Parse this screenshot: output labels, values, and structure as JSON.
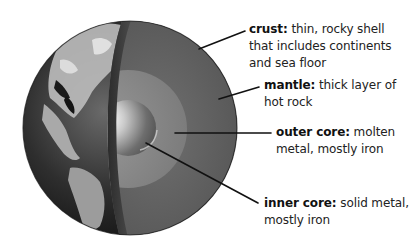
{
  "diagram": {
    "colors": {
      "background": "#ffffff",
      "ocean_dark": "#1c1c1c",
      "land_light": "#c8c8c8",
      "crust_band": "#3e3e3e",
      "mantle": "#626262",
      "outer_core": "#8a8a8a",
      "inner_core_highlight": "#f2f2f2",
      "leader_line": "#111111",
      "text": "#222222"
    },
    "layers": [
      {
        "id": "crust",
        "term": "crust:",
        "lines": [
          "thin, rocky shell",
          "that includes continents",
          "and sea floor"
        ]
      },
      {
        "id": "mantle",
        "term": "mantle:",
        "lines": [
          "thick layer of",
          "hot rock"
        ]
      },
      {
        "id": "outer-core",
        "term": "outer core:",
        "lines": [
          "molten",
          "metal, mostly iron"
        ]
      },
      {
        "id": "inner-core",
        "term": "inner core:",
        "lines": [
          "solid metal,",
          "mostly iron"
        ]
      }
    ]
  }
}
